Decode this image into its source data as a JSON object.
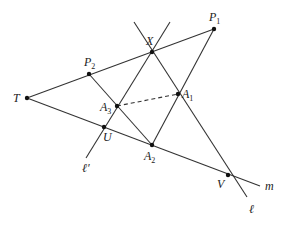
{
  "figure": {
    "width": 289,
    "height": 227,
    "colors": {
      "stroke": "#333333",
      "point": "#111111",
      "label": "#222222",
      "background": "#ffffff"
    },
    "points": [
      {
        "id": "T",
        "x": 27,
        "y": 98,
        "label": "T",
        "sub": "",
        "lx": 13,
        "ly": 102
      },
      {
        "id": "P2",
        "x": 89,
        "y": 74,
        "label": "P",
        "sub": "2",
        "lx": 84,
        "ly": 66
      },
      {
        "id": "P1",
        "x": 214,
        "y": 29,
        "label": "P",
        "sub": "1",
        "lx": 209,
        "ly": 21
      },
      {
        "id": "X",
        "x": 152,
        "y": 52,
        "label": "X",
        "sub": "",
        "lx": 146,
        "ly": 45
      },
      {
        "id": "A3",
        "x": 117,
        "y": 106,
        "label": "A",
        "sub": "3",
        "lx": 100,
        "ly": 111
      },
      {
        "id": "A1",
        "x": 178,
        "y": 94,
        "label": "A",
        "sub": "1",
        "lx": 182,
        "ly": 98
      },
      {
        "id": "A2",
        "x": 152,
        "y": 145,
        "label": "A",
        "sub": "2",
        "lx": 144,
        "ly": 160
      },
      {
        "id": "U",
        "x": 104,
        "y": 127,
        "label": "U",
        "sub": "",
        "lx": 103,
        "ly": 141
      },
      {
        "id": "V",
        "x": 228,
        "y": 175,
        "label": "V",
        "sub": "",
        "lx": 217,
        "ly": 188
      }
    ],
    "lines": [
      {
        "name": "line-T-P1",
        "x1": 27,
        "y1": 98,
        "x2": 214,
        "y2": 29,
        "style": "solid"
      },
      {
        "name": "line-m",
        "x1": 27,
        "y1": 98,
        "x2": 260,
        "y2": 186,
        "style": "solid"
      },
      {
        "name": "line-l",
        "x1": 134,
        "y1": 22,
        "x2": 247,
        "y2": 197,
        "style": "solid"
      },
      {
        "name": "line-l-prime",
        "x1": 170,
        "y1": 22,
        "x2": 86,
        "y2": 158,
        "style": "solid"
      },
      {
        "name": "line-P1-A2",
        "x1": 214,
        "y1": 29,
        "x2": 152,
        "y2": 145,
        "style": "solid"
      },
      {
        "name": "line-P2-A2",
        "x1": 89,
        "y1": 74,
        "x2": 152,
        "y2": 145,
        "style": "solid"
      },
      {
        "name": "line-A3-A1",
        "x1": 117,
        "y1": 106,
        "x2": 178,
        "y2": 94,
        "style": "dashed"
      }
    ],
    "line_labels": [
      {
        "id": "m",
        "text": "m",
        "x": 265,
        "y": 190
      },
      {
        "id": "l",
        "text": "ℓ",
        "x": 249,
        "y": 213
      },
      {
        "id": "l-prime",
        "text": "ℓ′",
        "x": 82,
        "y": 172
      }
    ]
  }
}
